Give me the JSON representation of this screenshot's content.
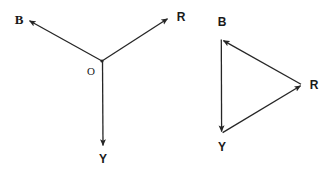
{
  "figure": {
    "type": "diagram",
    "background_color": "#ffffff",
    "stroke_color": "#262626",
    "text_color": "#1a1a1a"
  },
  "left_diagram": {
    "name": "concurrent-vectors",
    "origin_label": "O",
    "origin_point": {
      "x": 102,
      "y": 61
    },
    "vectors": [
      {
        "label": "B",
        "from": {
          "x": 102,
          "y": 61
        },
        "to": {
          "x": 28,
          "y": 20
        },
        "label_pos": {
          "x": 19,
          "y": 19
        }
      },
      {
        "label": "R",
        "from": {
          "x": 102,
          "y": 61
        },
        "to": {
          "x": 169,
          "y": 18
        },
        "label_pos": {
          "x": 181,
          "y": 17
        }
      },
      {
        "label": "Y",
        "from": {
          "x": 102,
          "y": 61
        },
        "to": {
          "x": 103,
          "y": 147
        },
        "label_pos": {
          "x": 103,
          "y": 159
        }
      }
    ],
    "origin_label_pos": {
      "x": 91,
      "y": 71
    }
  },
  "right_diagram": {
    "name": "closed-vector-triangle",
    "vertices": [
      {
        "label": "B",
        "point": {
          "x": 222,
          "y": 39
        },
        "label_pos": {
          "x": 222,
          "y": 22
        }
      },
      {
        "label": "R",
        "point": {
          "x": 302,
          "y": 85
        },
        "label_pos": {
          "x": 314,
          "y": 85
        }
      },
      {
        "label": "Y",
        "point": {
          "x": 222,
          "y": 133
        },
        "label_pos": {
          "x": 222,
          "y": 147
        }
      }
    ],
    "edges": [
      {
        "name": "edge-R-to-B",
        "from": {
          "x": 302,
          "y": 85
        },
        "to": {
          "x": 222,
          "y": 39
        },
        "arrow_at": "to"
      },
      {
        "name": "edge-B-to-Y",
        "from": {
          "x": 221,
          "y": 39
        },
        "to": {
          "x": 221,
          "y": 133
        },
        "arrow_at": "to"
      },
      {
        "name": "edge-Y-to-R",
        "from": {
          "x": 222,
          "y": 133
        },
        "to": {
          "x": 302,
          "y": 85
        },
        "arrow_at": "to"
      }
    ]
  }
}
